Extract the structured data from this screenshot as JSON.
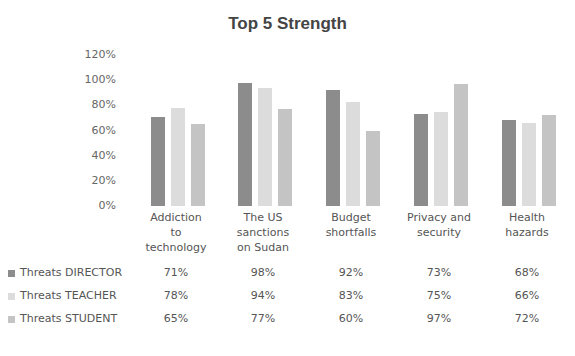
{
  "chart_data": {
    "type": "bar",
    "title": "Top 5 Strength",
    "xlabel": "",
    "ylabel": "",
    "ylim": [
      0,
      1.2
    ],
    "yticks": [
      "0%",
      "20%",
      "40%",
      "60%",
      "80%",
      "100%",
      "120%"
    ],
    "grid": false,
    "legend_position": "data-table-below",
    "categories": [
      "Addiction to technology",
      "The US sanctions on Sudan",
      "Budget shortfalls",
      "Privacy and security",
      "Health hazards"
    ],
    "series": [
      {
        "name": "Threats DIRECTOR",
        "color": "#8c8c8c",
        "values": [
          0.71,
          0.98,
          0.92,
          0.73,
          0.68
        ],
        "labels": [
          "71%",
          "98%",
          "92%",
          "73%",
          "68%"
        ]
      },
      {
        "name": "Threats TEACHER",
        "color": "#dcdcdc",
        "values": [
          0.78,
          0.94,
          0.83,
          0.75,
          0.66
        ],
        "labels": [
          "78%",
          "94%",
          "83%",
          "75%",
          "66%"
        ]
      },
      {
        "name": "Threats STUDENT",
        "color": "#c4c4c4",
        "values": [
          0.65,
          0.77,
          0.6,
          0.97,
          0.72
        ],
        "labels": [
          "65%",
          "77%",
          "60%",
          "97%",
          "72%"
        ]
      }
    ]
  },
  "category_lines": [
    [
      "Addiction",
      "to",
      "technology"
    ],
    [
      "The US",
      "sanctions",
      "on Sudan"
    ],
    [
      "Budget",
      "shortfalls"
    ],
    [
      "Privacy and",
      "security"
    ],
    [
      "Health",
      "hazards"
    ]
  ]
}
